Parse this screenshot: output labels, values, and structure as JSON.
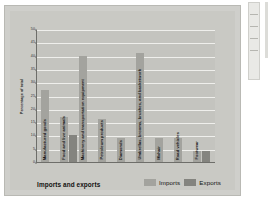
{
  "chart_data": {
    "type": "bar",
    "title": "",
    "xlabel": "Imports and exports",
    "ylabel": "Percentage of total",
    "ylim": [
      0,
      50
    ],
    "yticks": [
      0,
      5,
      10,
      15,
      20,
      25,
      30,
      35,
      40,
      45,
      50
    ],
    "grid": true,
    "legend_position": "bottom-right",
    "categories": [
      "Manufactured goods",
      "Food and live animals",
      "Machinery and transportation equipment",
      "Petroleum products",
      "Diamonds",
      "Umbrellas, brooms, brushes, and basketwork",
      "Mohair",
      "Road vehicles",
      "Footwear"
    ],
    "series": [
      {
        "name": "Imports",
        "values": [
          27,
          17,
          40,
          16,
          9,
          41,
          9,
          9,
          4
        ]
      },
      {
        "name": "Exports",
        "values": [
          null,
          10,
          null,
          null,
          null,
          null,
          null,
          null,
          4
        ]
      }
    ]
  },
  "legend": {
    "imports_label": "Imports",
    "exports_label": "Exports"
  },
  "colors": {
    "imports": "#a3a39e",
    "exports": "#84847f",
    "plot_background": "#c4c4bf",
    "card_background": "#c9c9c4",
    "gridline": "#efefec",
    "axis": "#6e6e6a"
  }
}
